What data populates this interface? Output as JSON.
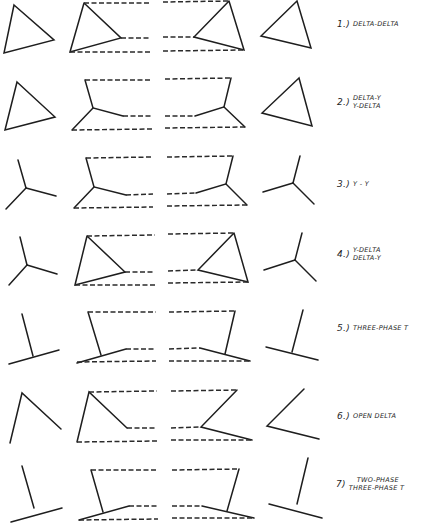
{
  "diagram": {
    "columns": [
      "primary-source",
      "primary-transformer-windings",
      "secondary-transformer-windings",
      "secondary-load"
    ],
    "colors": {
      "line": "#1e1e1e",
      "background": "#ffffff"
    },
    "connections": [
      {
        "number": "1.)",
        "lines": [
          "DELTA-DELTA"
        ]
      },
      {
        "number": "2.)",
        "lines": [
          "DELTA-Y",
          "Y-DELTA"
        ]
      },
      {
        "number": "3.)",
        "lines": [
          "Y - Y"
        ]
      },
      {
        "number": "4.)",
        "lines": [
          "Y-DELTA",
          "DELTA-Y"
        ]
      },
      {
        "number": "5.)",
        "lines": [
          "THREE-PHASE T"
        ]
      },
      {
        "number": "6.)",
        "lines": [
          "OPEN DELTA"
        ]
      },
      {
        "number": "7)",
        "lines": [
          "TWO-PHASE",
          "THREE-PHASE T"
        ]
      }
    ]
  }
}
